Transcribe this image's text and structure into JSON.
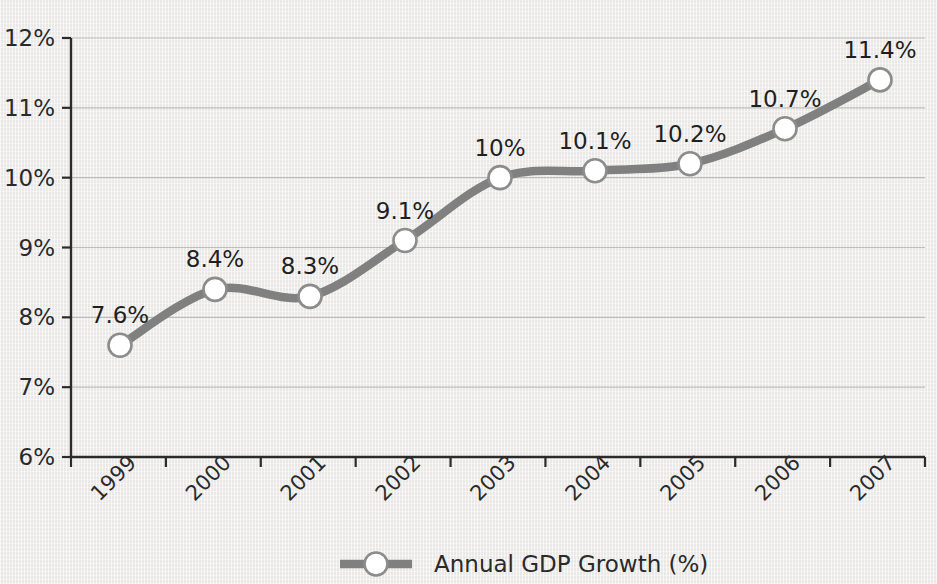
{
  "chart_data": {
    "type": "line",
    "title": "",
    "xlabel": "",
    "ylabel": "",
    "categories": [
      "1999",
      "2000",
      "2001",
      "2002",
      "2003",
      "2004",
      "2005",
      "2006",
      "2007"
    ],
    "series": [
      {
        "name": "Annual GDP Growth (%)",
        "values": [
          7.6,
          8.4,
          8.3,
          9.1,
          10.0,
          10.1,
          10.2,
          10.7,
          11.4
        ],
        "point_labels": [
          "7.6%",
          "8.4%",
          "8.3%",
          "9.1%",
          "10%",
          "10.1%",
          "10.2%",
          "10.7%",
          "11.4%"
        ],
        "line_color": "#808080",
        "marker_fill": "#ffffff",
        "marker_stroke": "#8c8c8c"
      }
    ],
    "ylim": [
      6,
      12
    ],
    "ytick_values": [
      6,
      7,
      8,
      9,
      10,
      11,
      12
    ],
    "ytick_labels": [
      "6%",
      "7%",
      "8%",
      "9%",
      "10%",
      "11%",
      "12%"
    ],
    "grid": true,
    "grid_color": "#bdbdbd",
    "legend_position": "bottom",
    "legend": [
      {
        "label": "Annual GDP Growth (%)",
        "marker": "circle-on-line"
      }
    ],
    "background_color": "#efeeec",
    "axis_color": "#2b2b2b",
    "xtick_rotation": -45
  }
}
